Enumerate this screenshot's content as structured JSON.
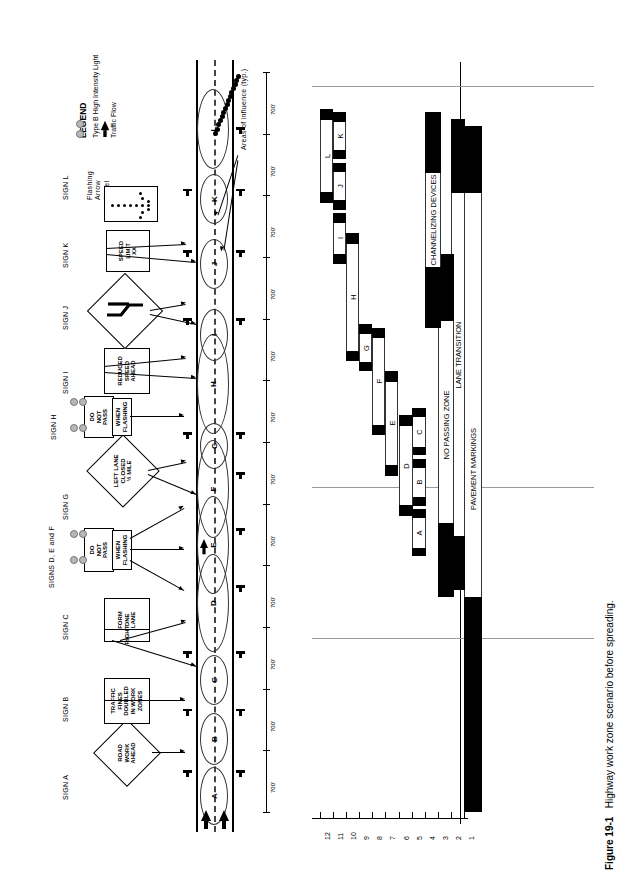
{
  "figure": {
    "number": "Figure 19-1",
    "caption": "Highway work zone scenario before spreading."
  },
  "legend": {
    "title": "LEGEND",
    "items": [
      {
        "symbol": "two-gray-circles",
        "label": "Type B High Intensity Light"
      },
      {
        "symbol": "black-arrow",
        "label": "Traffic Flow"
      }
    ]
  },
  "plan_view": {
    "annotation_areas_of_influence": "Areas of influence (typ.)",
    "spacing_label": "700'",
    "spacing_count": 12,
    "areas_of_influence": [
      "A",
      "B",
      "C",
      "D",
      "E",
      "F",
      "G",
      "H",
      "I",
      "J",
      "K",
      "L"
    ],
    "signs": [
      {
        "id": "SIGN A",
        "label": "SIGN A",
        "shape": "diamond",
        "lines": [
          "ROAD",
          "WORK",
          "AHEAD"
        ]
      },
      {
        "id": "SIGN B",
        "label": "SIGN B",
        "shape": "rect",
        "lines": [
          "TRAFFIC",
          "FINES",
          "DOUBLED",
          "IN WORK",
          "ZONES"
        ]
      },
      {
        "id": "SIGN C",
        "label": "SIGN C",
        "shape": "rect-split",
        "lines": [
          "FORM",
          "ONE",
          "LANE"
        ],
        "sublines": [
          "RIGHT"
        ]
      },
      {
        "id": "SIGNS D, E and F",
        "label": "SIGNS D, E and F",
        "shape": "rect-flashing",
        "lines": [
          "DO",
          "NOT",
          "PASS"
        ],
        "sublines": [
          "WHEN",
          "FLASHING"
        ]
      },
      {
        "id": "SIGN G",
        "label": "SIGN G",
        "shape": "diamond",
        "lines": [
          "LEFT LANE",
          "CLOSED",
          "½ MILE"
        ]
      },
      {
        "id": "SIGN H",
        "label": "SIGN H",
        "shape": "rect-flashing",
        "lines": [
          "DO",
          "NOT",
          "PASS"
        ],
        "sublines": [
          "WHEN",
          "FLASHING"
        ]
      },
      {
        "id": "SIGN I",
        "label": "SIGN I",
        "shape": "rect",
        "lines": [
          "REDUCED",
          "SPEED",
          "AHEAD"
        ]
      },
      {
        "id": "SIGN J",
        "label": "SIGN J",
        "shape": "diamond-symbol",
        "lines": []
      },
      {
        "id": "SIGN K",
        "label": "SIGN K",
        "shape": "rect",
        "lines": [
          "SPEED",
          "LIMIT",
          "XX"
        ]
      },
      {
        "id": "SIGN L",
        "label": "SIGN L",
        "shape": "arrow-panel",
        "lines": [
          "Flashing",
          "Arrow",
          "Panel"
        ]
      }
    ]
  },
  "chart_data": {
    "type": "bar",
    "title": "",
    "xlabel": "",
    "ylabel": "",
    "orientation": "horizontal-rotated",
    "axis_ticks": [
      1,
      2,
      3,
      4,
      5,
      6,
      7,
      8,
      9,
      10,
      11,
      12
    ],
    "axis_range": [
      1,
      12
    ],
    "grid": true,
    "categories": [
      "PAVEMENT MARKINGS",
      "LANE TRANSITION",
      "NO PASSING ZONE",
      "CHANNELIZING DEVICES",
      "A",
      "B",
      "C",
      "D",
      "E",
      "F",
      "G",
      "H",
      "I",
      "J",
      "K",
      "L"
    ],
    "bars": [
      {
        "row": 1,
        "label": "PAVEMENT MARKINGS",
        "start": 0.0,
        "end": 11.2,
        "cap_start": 3.2,
        "cap_end": 1.0,
        "style": "long"
      },
      {
        "row": 2,
        "label": "LANE TRANSITION",
        "start": 4.3,
        "end": 11.3,
        "cap_start": 0.8,
        "cap_end": 1.1,
        "style": "long"
      },
      {
        "row": 3,
        "label": "NO PASSING ZONE",
        "start": 4.2,
        "end": 9.3,
        "cap_start": 1.1,
        "cap_end": 1.0,
        "style": "long"
      },
      {
        "row": 4,
        "label": "CHANNELIZING DEVICES",
        "start": 8.2,
        "end": 11.4,
        "cap_start": 0.9,
        "cap_end": 0.9,
        "style": "long"
      },
      {
        "row": 5,
        "label": "A",
        "start": 4.8,
        "end": 5.5,
        "cap_start": 0.13,
        "cap_end": 0.13,
        "style": "short"
      },
      {
        "row": 5,
        "label": "B",
        "start": 5.55,
        "end": 6.25,
        "cap_start": 0.13,
        "cap_end": 0.13,
        "style": "short"
      },
      {
        "row": 5,
        "label": "C",
        "start": 6.3,
        "end": 7.0,
        "cap_start": 0.13,
        "cap_end": 0.13,
        "style": "short"
      },
      {
        "row": 6,
        "label": "D",
        "start": 5.4,
        "end": 6.9,
        "cap_start": 0.16,
        "cap_end": 0.16,
        "style": "short"
      },
      {
        "row": 7,
        "label": "E",
        "start": 6.0,
        "end": 7.55,
        "cap_start": 0.16,
        "cap_end": 0.16,
        "style": "short"
      },
      {
        "row": 8,
        "label": "F",
        "start": 6.6,
        "end": 8.2,
        "cap_start": 0.16,
        "cap_end": 0.16,
        "style": "short"
      },
      {
        "row": 9,
        "label": "G",
        "start": 7.55,
        "end": 8.25,
        "cap_start": 0.14,
        "cap_end": 0.14,
        "style": "short"
      },
      {
        "row": 10,
        "label": "H",
        "start": 7.7,
        "end": 9.6,
        "cap_start": 0.16,
        "cap_end": 0.16,
        "style": "short"
      },
      {
        "row": 11,
        "label": "I",
        "start": 9.15,
        "end": 9.9,
        "cap_start": 0.14,
        "cap_end": 0.14,
        "style": "short"
      },
      {
        "row": 11,
        "label": "J",
        "start": 9.95,
        "end": 10.65,
        "cap_start": 0.14,
        "cap_end": 0.14,
        "style": "short"
      },
      {
        "row": 11,
        "label": "K",
        "start": 10.7,
        "end": 11.4,
        "cap_start": 0.14,
        "cap_end": 0.14,
        "style": "short"
      },
      {
        "row": 12,
        "label": "L",
        "start": 10.05,
        "end": 11.45,
        "cap_start": 0.16,
        "cap_end": 0.16,
        "style": "short"
      }
    ]
  }
}
